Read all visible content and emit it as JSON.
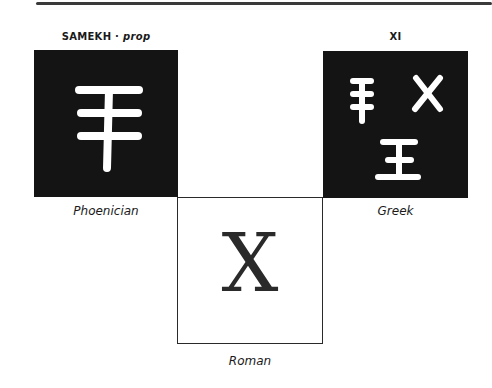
{
  "header": {
    "left_title": "SAMEKH",
    "left_separator": "·",
    "left_subtitle": "prop",
    "right_title": "XI"
  },
  "panels": [
    {
      "label": "Phoenician",
      "glyph": "samekh-glyph",
      "style": "black"
    },
    {
      "label": "Greek",
      "glyph": "xi-glyphs",
      "style": "black"
    },
    {
      "label": "Roman",
      "glyph": "X",
      "style": "white"
    }
  ],
  "colors": {
    "panel_dark": "#141414",
    "glyph_light": "#ffffff",
    "ink": "#2a2a2a"
  }
}
